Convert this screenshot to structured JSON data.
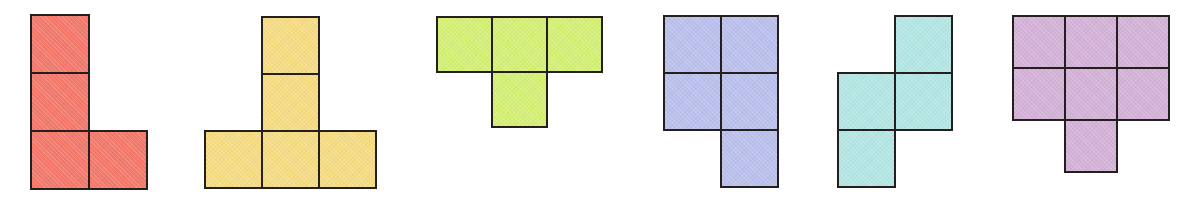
{
  "canvas": {
    "width": 1193,
    "height": 197,
    "background": "#ffffff",
    "outline_color": "#241f1c",
    "outline_width": 2
  },
  "shapes": [
    {
      "id": "shape-1",
      "name": "red-l-tetromino",
      "label": "L tetromino",
      "color": "#f4796b",
      "cell_size": 58,
      "left": 31,
      "top": 15,
      "columns": 2,
      "rows": 3,
      "cell_count": 4,
      "grid": [
        [
          1,
          0
        ],
        [
          1,
          0
        ],
        [
          1,
          1
        ]
      ]
    },
    {
      "id": "shape-2",
      "name": "yellow-t-pentomino",
      "label": "T pentomino",
      "color": "#f5dc82",
      "cell_size": 57,
      "left": 205,
      "top": 17,
      "columns": 3,
      "rows": 3,
      "cell_count": 5,
      "grid": [
        [
          0,
          1,
          0
        ],
        [
          0,
          1,
          0
        ],
        [
          1,
          1,
          1
        ]
      ]
    },
    {
      "id": "shape-3",
      "name": "green-t-tetromino",
      "label": "T tetromino",
      "color": "#d4f075",
      "cell_size": 55,
      "left": 437,
      "top": 17,
      "columns": 3,
      "rows": 2,
      "cell_count": 4,
      "grid": [
        [
          1,
          1,
          1
        ],
        [
          0,
          1,
          0
        ]
      ]
    },
    {
      "id": "shape-4",
      "name": "blue-p-pentomino",
      "label": "P pentomino",
      "color": "#bac0ec",
      "cell_size": 57,
      "left": 664,
      "top": 16,
      "columns": 2,
      "rows": 3,
      "cell_count": 5,
      "grid": [
        [
          1,
          1
        ],
        [
          1,
          1
        ],
        [
          0,
          1
        ]
      ]
    },
    {
      "id": "shape-5",
      "name": "cyan-s-tetromino",
      "label": "S tetromino",
      "color": "#b3e6e4",
      "cell_size": 57,
      "left": 838,
      "top": 16,
      "columns": 2,
      "rows": 3,
      "cell_count": 4,
      "grid": [
        [
          0,
          1
        ],
        [
          1,
          1
        ],
        [
          1,
          0
        ]
      ]
    },
    {
      "id": "shape-6",
      "name": "purple-heptomino",
      "label": "Heptomino",
      "color": "#d4b2d8",
      "cell_size": 52,
      "left": 1013,
      "top": 16,
      "columns": 3,
      "rows": 3,
      "cell_count": 7,
      "grid": [
        [
          1,
          1,
          1
        ],
        [
          1,
          1,
          1
        ],
        [
          0,
          1,
          0
        ]
      ]
    }
  ]
}
